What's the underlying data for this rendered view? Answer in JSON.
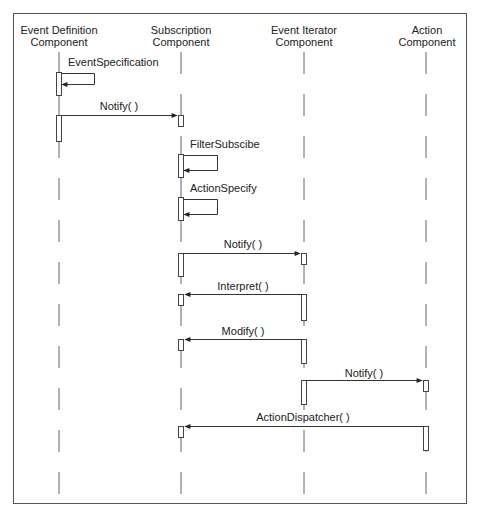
{
  "diagram": {
    "type": "sequence",
    "frame": {
      "x": 13,
      "y": 13,
      "w": 453,
      "h": 490
    },
    "lifelines": [
      {
        "id": "edc",
        "line1": "Event Definition",
        "line2": "Component",
        "x": 59
      },
      {
        "id": "sub",
        "line1": "Subscription",
        "line2": "Component",
        "x": 181
      },
      {
        "id": "eic",
        "line1": "Event Iterator",
        "line2": "Component",
        "x": 304
      },
      {
        "id": "act",
        "line1": "Action",
        "line2": "Component",
        "x": 426
      }
    ],
    "messages": [
      {
        "label": "EventSpecification",
        "from": "edc",
        "to": "edc",
        "self": true
      },
      {
        "label": "Notify( )",
        "from": "edc",
        "to": "sub"
      },
      {
        "label": "FilterSubscibe",
        "from": "sub",
        "to": "sub",
        "self": true
      },
      {
        "label": "ActionSpecify",
        "from": "sub",
        "to": "sub",
        "self": true
      },
      {
        "label": "Notify( )",
        "from": "sub",
        "to": "eic"
      },
      {
        "label": "Interpret( )",
        "from": "eic",
        "to": "sub"
      },
      {
        "label": "Modify( )",
        "from": "eic",
        "to": "sub"
      },
      {
        "label": "Notify( )",
        "from": "eic",
        "to": "act"
      },
      {
        "label": "ActionDispatcher( )",
        "from": "act",
        "to": "sub"
      }
    ]
  }
}
